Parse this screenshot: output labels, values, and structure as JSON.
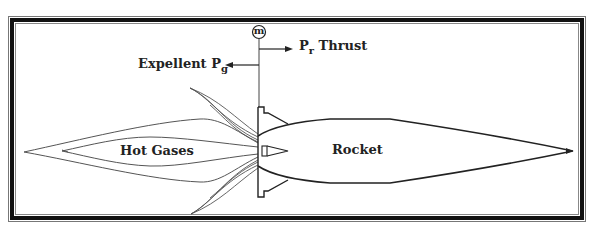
{
  "diagram": {
    "type": "rocket-propulsion-schematic",
    "labels": {
      "mass_flow_symbol": "m",
      "thrust_main": "P",
      "thrust_sub": "r",
      "thrust_word": "Thrust",
      "expellent_word": "Expellent",
      "expellent_main": "P",
      "expellent_sub": "g",
      "hot_gases": "Hot Gases",
      "rocket": "Rocket"
    },
    "arrows": [
      {
        "name": "thrust-arrow",
        "direction": "right",
        "label": "Pr Thrust"
      },
      {
        "name": "expellent-arrow",
        "direction": "left",
        "label": "Expellent Pg"
      }
    ],
    "colors": {
      "line": "#222222",
      "plume_line": "#555555",
      "background": "#ffffff",
      "frame": "#111111"
    }
  }
}
